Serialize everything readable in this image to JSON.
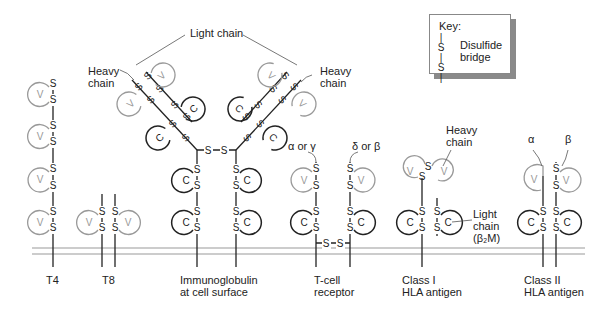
{
  "key": {
    "title": "Key:",
    "symbol_top": "S",
    "symbol_bottom": "S",
    "description_line1": "Disulfide",
    "description_line2": "bridge"
  },
  "labels": {
    "light_chain": "Light chain",
    "heavy_chain_left_1": "Heavy",
    "heavy_chain_left_2": "chain",
    "heavy_chain_right_1": "Heavy",
    "heavy_chain_right_2": "chain",
    "tcr_alpha": "α or γ",
    "tcr_delta": "δ or β",
    "class1_heavy_1": "Heavy",
    "class1_heavy_2": "chain",
    "class1_light_1": "Light",
    "class1_light_2": "chain",
    "class1_light_3": "(β₂M)",
    "class2_alpha": "α",
    "class2_beta": "β"
  },
  "molecules": [
    {
      "id": "t4",
      "line1": "T4",
      "line2": ""
    },
    {
      "id": "t8",
      "line1": "T8",
      "line2": ""
    },
    {
      "id": "ig",
      "line1": "Immunoglobulin",
      "line2": "at cell surface"
    },
    {
      "id": "tcr",
      "line1": "T-cell",
      "line2": "receptor"
    },
    {
      "id": "class1",
      "line1": "Class I",
      "line2": "HLA antigen"
    },
    {
      "id": "class2",
      "line1": "Class II",
      "line2": "HLA antigen"
    }
  ],
  "domain_letters": {
    "variable": "V",
    "constant": "C",
    "sulfur": "S"
  },
  "colors": {
    "variable_domain": "#999999",
    "constant_domain": "#222222",
    "membrane": "#9a9a9a",
    "text": "#222222"
  }
}
